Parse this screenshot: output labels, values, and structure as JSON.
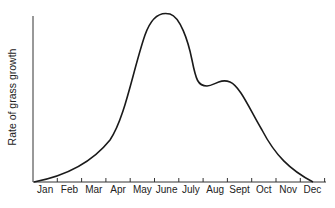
{
  "chart_data": {
    "type": "line",
    "title": "",
    "xlabel": "",
    "ylabel": "Rate of grass growth",
    "categories": [
      "Jan",
      "Feb",
      "Mar",
      "Apr",
      "May",
      "June",
      "July",
      "Aug",
      "Sept",
      "Oct",
      "Nov",
      "Dec"
    ],
    "series": [
      {
        "name": "Rate of grass growth",
        "values": [
          2,
          8,
          22,
          45,
          82,
          98,
          75,
          68,
          45,
          20,
          6,
          0
        ]
      }
    ],
    "ylim": [
      0,
      100
    ],
    "y_ticks": false,
    "grid": false,
    "legend": null
  },
  "axis": {
    "ylabel": "Rate of grass growth",
    "months": [
      "Jan",
      "Feb",
      "Mar",
      "Apr",
      "May",
      "June",
      "July",
      "Aug",
      "Sept",
      "Oct",
      "Nov",
      "Dec"
    ]
  },
  "colors": {
    "line": "#1a1a1a",
    "axis": "#333333",
    "text": "#222222"
  }
}
